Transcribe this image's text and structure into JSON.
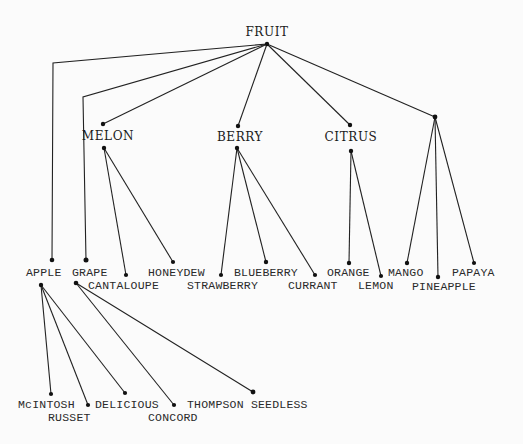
{
  "root": {
    "label": "FRUIT",
    "children": [
      {
        "id": "apple",
        "label": "APPLE",
        "children": [
          {
            "id": "mcintosh",
            "label": "McINTOSH"
          },
          {
            "id": "russet",
            "label": "RUSSET"
          },
          {
            "id": "delicious",
            "label": "DELICIOUS"
          }
        ]
      },
      {
        "id": "grape",
        "label": "GRAPE",
        "children": [
          {
            "id": "concord",
            "label": "CONCORD"
          },
          {
            "id": "thompson",
            "label": "THOMPSON SEEDLESS"
          }
        ]
      },
      {
        "id": "melon",
        "label": "MELON",
        "children": [
          {
            "id": "cantaloupe",
            "label": "CANTALOUPE"
          },
          {
            "id": "honeydew",
            "label": "HONEYDEW"
          }
        ]
      },
      {
        "id": "berry",
        "label": "BERRY",
        "children": [
          {
            "id": "strawberry",
            "label": "STRAWBERRY"
          },
          {
            "id": "blueberry",
            "label": "BLUEBERRY"
          },
          {
            "id": "currant",
            "label": "CURRANT"
          }
        ]
      },
      {
        "id": "citrus",
        "label": "CITRUS",
        "children": [
          {
            "id": "orange",
            "label": "ORANGE"
          },
          {
            "id": "lemon",
            "label": "LEMON"
          }
        ]
      },
      {
        "id": "tropical",
        "label": "",
        "children": [
          {
            "id": "mango",
            "label": "MANGO"
          },
          {
            "id": "pineapple",
            "label": "PINEAPPLE"
          },
          {
            "id": "papaya",
            "label": "PAPAYA"
          }
        ]
      }
    ]
  }
}
